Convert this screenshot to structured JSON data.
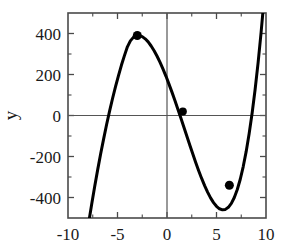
{
  "chart_data": {
    "type": "line",
    "title": "",
    "xlabel": "",
    "ylabel": "y",
    "xlim": [
      -10,
      10
    ],
    "ylim": [
      -500,
      500
    ],
    "grid": false,
    "legend": null,
    "axis_lines": {
      "x_zero_line": 0,
      "y_zero_line": 0
    },
    "xticks": [
      -10,
      -5,
      0,
      5,
      10
    ],
    "xtick_labels": [
      "-10",
      "-5",
      "0",
      "5",
      "10"
    ],
    "yticks": [
      -400,
      -200,
      0,
      200,
      400
    ],
    "ytick_labels": [
      "-400",
      "-200",
      "0",
      "200",
      "400"
    ],
    "minor_xticks": [
      -7.5,
      -2.5,
      2.5,
      7.5
    ],
    "minor_yticks": [
      -300,
      -100,
      100,
      300
    ],
    "series": [
      {
        "name": "cubic curve",
        "type": "line",
        "color": "#000000",
        "linewidth": 3,
        "x": [
          -7.9,
          -7.6,
          -7.3,
          -7.0,
          -6.7,
          -6.4,
          -6.1,
          -5.8,
          -5.5,
          -5.2,
          -4.9,
          -4.6,
          -4.3,
          -4.0,
          -3.7,
          -3.4,
          -3.1,
          -2.8,
          -2.5,
          -2.2,
          -1.9,
          -1.6,
          -1.3,
          -1.0,
          -0.7,
          -0.4,
          -0.1,
          0.2,
          0.5,
          0.8,
          1.1,
          1.4,
          1.7,
          2.0,
          2.3,
          2.6,
          2.9,
          3.2,
          3.5,
          3.8,
          4.1,
          4.4,
          4.7,
          5.0,
          5.3,
          5.6,
          5.9,
          6.2,
          6.5,
          6.8,
          7.1,
          7.4,
          7.7,
          8.0,
          8.3,
          8.6,
          8.9,
          9.2,
          9.5,
          9.8,
          10.0
        ],
        "y": [
          -520,
          -430,
          -345,
          -264,
          -187,
          -114,
          -44,
          21,
          83,
          141,
          195,
          246,
          292,
          335,
          364,
          381,
          389,
          390,
          385,
          374,
          359,
          339,
          316,
          289,
          259,
          226,
          191,
          153,
          114,
          73,
          31,
          -12,
          -56,
          -100,
          -144,
          -187,
          -229,
          -269,
          -307,
          -342,
          -374,
          -402,
          -425,
          -443,
          -455,
          -460,
          -458,
          -448,
          -429,
          -400,
          -361,
          -311,
          -249,
          -175,
          -88,
          12,
          127,
          257,
          403,
          565,
          680
        ]
      }
    ],
    "markers": [
      {
        "label": "local maximum",
        "x": -3.0,
        "y": 390,
        "marker": "circle",
        "color": "#000000",
        "size": 7
      },
      {
        "label": "inflection point",
        "x": 1.6,
        "y": 20,
        "marker": "circle",
        "color": "#000000",
        "size": 6
      },
      {
        "label": "local minimum",
        "x": 6.3,
        "y": -340,
        "marker": "circle",
        "color": "#000000",
        "size": 7
      }
    ]
  },
  "colors": {
    "curve": "#000000",
    "frame": "#4a4a4a",
    "zero_axis": "#555555",
    "text": "#1a1a1a",
    "background": "#ffffff"
  }
}
